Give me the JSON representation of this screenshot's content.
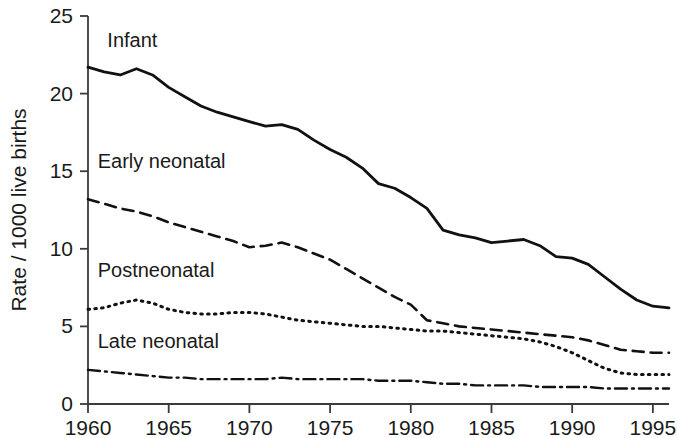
{
  "chart_data": {
    "type": "line",
    "title": "",
    "xlabel": "",
    "ylabel": "Rate / 1000 live births",
    "xlim": [
      1960,
      1996
    ],
    "ylim": [
      0,
      25
    ],
    "yticks": [
      0,
      5,
      10,
      15,
      20,
      25
    ],
    "xticks": [
      1960,
      1965,
      1970,
      1975,
      1980,
      1985,
      1990,
      1995
    ],
    "ytick_labels": [
      "0",
      "5",
      "10",
      "15",
      "20",
      "25"
    ],
    "xtick_labels": [
      "1960",
      "1965",
      "1970",
      "1975",
      "1980",
      "1985",
      "1990",
      "1995"
    ],
    "grid": false,
    "legend_position": "inline-labels",
    "x": [
      1960,
      1961,
      1962,
      1963,
      1964,
      1965,
      1966,
      1967,
      1968,
      1969,
      1970,
      1971,
      1972,
      1973,
      1974,
      1975,
      1976,
      1977,
      1978,
      1979,
      1980,
      1981,
      1982,
      1983,
      1984,
      1985,
      1986,
      1987,
      1988,
      1989,
      1990,
      1991,
      1992,
      1993,
      1994,
      1995,
      1996
    ],
    "series": [
      {
        "name": "Infant",
        "style": "solid",
        "label": "Infant",
        "values": [
          21.7,
          21.4,
          21.2,
          21.6,
          21.2,
          20.4,
          19.8,
          19.2,
          18.8,
          18.5,
          18.2,
          17.9,
          18.0,
          17.7,
          17.0,
          16.4,
          15.9,
          15.2,
          14.2,
          13.9,
          13.3,
          12.6,
          11.2,
          10.9,
          10.7,
          10.4,
          10.5,
          10.6,
          10.2,
          9.5,
          9.4,
          9.0,
          8.2,
          7.4,
          6.7,
          6.3,
          6.2
        ]
      },
      {
        "name": "Early neonatal",
        "style": "dashed",
        "label": "Early neonatal",
        "values": [
          13.2,
          12.9,
          12.6,
          12.4,
          12.1,
          11.7,
          11.4,
          11.1,
          10.8,
          10.5,
          10.1,
          10.2,
          10.4,
          10.1,
          9.7,
          9.3,
          8.7,
          8.1,
          7.5,
          6.9,
          6.4,
          5.4,
          5.2,
          5.0,
          4.9,
          4.8,
          4.7,
          4.6,
          4.5,
          4.4,
          4.3,
          4.1,
          3.8,
          3.5,
          3.4,
          3.3,
          3.3
        ]
      },
      {
        "name": "Postneonatal",
        "style": "dotted",
        "label": "Postneonatal",
        "values": [
          6.1,
          6.2,
          6.5,
          6.7,
          6.5,
          6.1,
          5.9,
          5.8,
          5.8,
          5.9,
          5.9,
          5.8,
          5.6,
          5.4,
          5.3,
          5.2,
          5.1,
          5.0,
          5.0,
          4.9,
          4.8,
          4.7,
          4.7,
          4.6,
          4.5,
          4.4,
          4.3,
          4.2,
          4.0,
          3.7,
          3.3,
          2.8,
          2.3,
          2.0,
          1.9,
          1.9,
          1.9
        ]
      },
      {
        "name": "Late neonatal",
        "style": "dashdot",
        "label": "Late neonatal",
        "values": [
          2.2,
          2.1,
          2.0,
          1.9,
          1.8,
          1.7,
          1.7,
          1.6,
          1.6,
          1.6,
          1.6,
          1.6,
          1.7,
          1.6,
          1.6,
          1.6,
          1.6,
          1.6,
          1.5,
          1.5,
          1.5,
          1.4,
          1.3,
          1.3,
          1.2,
          1.2,
          1.2,
          1.2,
          1.1,
          1.1,
          1.1,
          1.1,
          1.0,
          1.0,
          1.0,
          1.0,
          1.0
        ]
      }
    ],
    "series_label_positions": [
      {
        "name": "Infant",
        "x": 1961.2,
        "y": 23.0
      },
      {
        "name": "Early neonatal",
        "x": 1960.6,
        "y": 15.2
      },
      {
        "name": "Postneonatal",
        "x": 1960.6,
        "y": 8.2
      },
      {
        "name": "Late neonatal",
        "x": 1960.6,
        "y": 3.6
      }
    ]
  }
}
